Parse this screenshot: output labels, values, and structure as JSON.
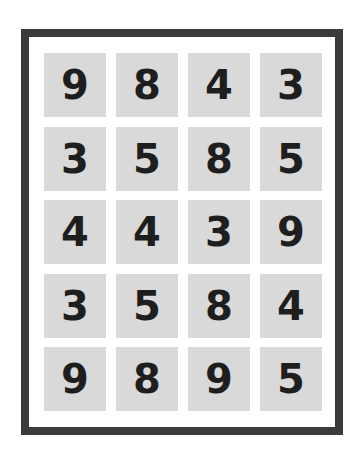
{
  "board": {
    "rows": 5,
    "cols": 4,
    "colors": {
      "frame": "#3b3b3b",
      "tile": "#d9d9d9",
      "digit": "#1e1e1e",
      "background": "#ffffff"
    },
    "tiles": [
      [
        "9",
        "8",
        "4",
        "3"
      ],
      [
        "3",
        "5",
        "8",
        "5"
      ],
      [
        "4",
        "4",
        "3",
        "9"
      ],
      [
        "3",
        "5",
        "8",
        "4"
      ],
      [
        "9",
        "8",
        "9",
        "5"
      ]
    ]
  }
}
